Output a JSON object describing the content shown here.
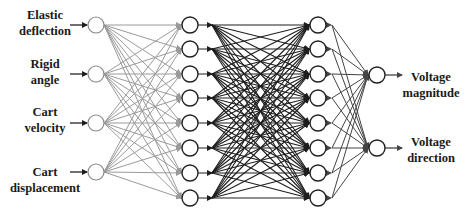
{
  "diagram": {
    "type": "neural-network",
    "inputs": [
      {
        "line1": "Elastic",
        "line2": "deflection"
      },
      {
        "line1": "Rigid",
        "line2": "angle"
      },
      {
        "line1": "Cart",
        "line2": "velocity"
      },
      {
        "line1": "Cart",
        "line2": "displacement"
      }
    ],
    "outputs": [
      {
        "line1": "Voltage",
        "line2": "magnitude"
      },
      {
        "line1": "Voltage",
        "line2": "direction"
      }
    ],
    "layers": [
      {
        "name": "input-layer",
        "x": 96,
        "nodes": [
          25,
          74,
          123,
          172
        ]
      },
      {
        "name": "hidden-layer-1",
        "x": 190,
        "nodes": [
          25,
          49,
          74,
          98,
          123,
          148,
          173,
          198
        ]
      },
      {
        "name": "hidden-layer-2",
        "x": 318,
        "nodes": [
          25,
          49,
          74,
          98,
          123,
          148,
          173,
          198
        ]
      },
      {
        "name": "output-layer",
        "x": 377,
        "nodes": [
          75,
          148
        ]
      }
    ],
    "node_radius": 8,
    "colors": {
      "input_edges": "#9a9a9a",
      "hidden_edges": "#1e1e1e",
      "output_edges": "#444444",
      "node_stroke_input": "#8a8a8a",
      "node_stroke": "#222222",
      "text": "#1a1a1a"
    }
  }
}
